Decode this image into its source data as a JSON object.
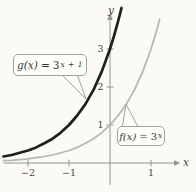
{
  "figure": {
    "background": "#fbfaf6",
    "axis_color": "#96948c",
    "text_color": "#46443c",
    "callout_fill": "#fdfdfa",
    "callout_border": "#a3a19a"
  },
  "chart_data": {
    "type": "line",
    "xlabel": "x",
    "ylabel": "y",
    "xlim": [
      -2.59,
      1.61
    ],
    "ylim": [
      -0.58,
      3.76
    ],
    "grid": false,
    "legend": "callout annotations on curves",
    "x_ticks": [
      {
        "value": -2,
        "label": "−2"
      },
      {
        "value": -1,
        "label": "−1"
      },
      {
        "value": 1,
        "label": "1"
      }
    ],
    "y_ticks": [
      {
        "value": 1,
        "label": "1"
      },
      {
        "value": 2,
        "label": "2"
      },
      {
        "value": 3,
        "label": "3"
      }
    ],
    "series": [
      {
        "name": "g",
        "label": "g(x) = 3^(x+1)",
        "color": "#211f1c",
        "stroke_width": 2.7,
        "points": [
          [
            -2.6,
            0.17
          ],
          [
            -2.4,
            0.21
          ],
          [
            -2.2,
            0.27
          ],
          [
            -2.0,
            0.33
          ],
          [
            -1.8,
            0.41
          ],
          [
            -1.6,
            0.52
          ],
          [
            -1.4,
            0.64
          ],
          [
            -1.2,
            0.8
          ],
          [
            -1.0,
            1.0
          ],
          [
            -0.8,
            1.25
          ],
          [
            -0.6,
            1.55
          ],
          [
            -0.4,
            1.93
          ],
          [
            -0.2,
            2.41
          ],
          [
            0.0,
            3.0
          ],
          [
            0.1,
            3.35
          ],
          [
            0.2,
            3.74
          ],
          [
            0.28,
            4.08
          ]
        ]
      },
      {
        "name": "f",
        "label": "f(x) = 3^x",
        "color": "#b5b4b0",
        "stroke_width": 1.7,
        "points": [
          [
            -2.6,
            0.06
          ],
          [
            -2.4,
            0.07
          ],
          [
            -2.2,
            0.09
          ],
          [
            -2.0,
            0.11
          ],
          [
            -1.8,
            0.14
          ],
          [
            -1.6,
            0.17
          ],
          [
            -1.4,
            0.21
          ],
          [
            -1.2,
            0.27
          ],
          [
            -1.0,
            0.33
          ],
          [
            -0.8,
            0.41
          ],
          [
            -0.6,
            0.52
          ],
          [
            -0.4,
            0.64
          ],
          [
            -0.2,
            0.8
          ],
          [
            0.0,
            1.0
          ],
          [
            0.2,
            1.25
          ],
          [
            0.4,
            1.55
          ],
          [
            0.6,
            1.93
          ],
          [
            0.8,
            2.41
          ],
          [
            1.0,
            3.0
          ],
          [
            1.1,
            3.35
          ],
          [
            1.21,
            3.78
          ]
        ]
      }
    ],
    "annotations": [
      {
        "series": "g",
        "text": "g(x) = 3^(x+1)",
        "attach": [
          -0.585,
          1.684
        ]
      },
      {
        "series": "f",
        "text": "f(x) = 3^x",
        "attach": [
          0.39,
          1.553
        ]
      }
    ]
  },
  "callouts": {
    "g": {
      "func": "g(x)",
      "eq": "=",
      "base": "3",
      "sup": "x + 1"
    },
    "f": {
      "func": "f(x)",
      "eq": "=",
      "base": "3",
      "sup": "x"
    }
  }
}
